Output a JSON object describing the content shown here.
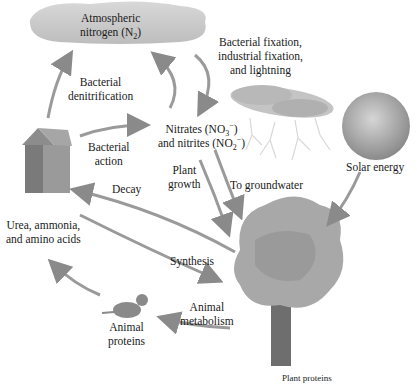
{
  "diagram": {
    "nodes": {
      "atmosphere": {
        "line1": "Atmospheric",
        "line2_pre": "nitrogen (N",
        "line2_sub": "2",
        "line2_post": ")"
      },
      "fixation": {
        "line1": "Bacterial fixation,",
        "line2": "industrial fixation,",
        "line3": "and lightning"
      },
      "nitrates": {
        "l1_pre": "Nitrates (NO",
        "l1_sub": "3",
        "l1_sup": "−",
        "l1_post": ")",
        "l2_pre": "and nitrites (NO",
        "l2_sub": "2",
        "l2_sup": "−",
        "l2_post": ")"
      },
      "solar": {
        "label": "Solar energy"
      },
      "urea": {
        "line1": "Urea, ammonia,",
        "line2": "and amino acids"
      },
      "animal_proteins": {
        "line1": "Animal",
        "line2": "proteins"
      },
      "plant": {
        "label": "Plant proteins"
      }
    },
    "processes": {
      "denitrification": {
        "line1": "Bacterial",
        "line2": "denitrification"
      },
      "bacterial_action": {
        "line1": "Bacterial",
        "line2": "action"
      },
      "plant_growth": {
        "line1": "Plant",
        "line2": "growth"
      },
      "groundwater": {
        "label": "To groundwater"
      },
      "decay": {
        "label": "Decay"
      },
      "synthesis": {
        "label": "Synthesis"
      },
      "animal_metabolism": {
        "line1": "Animal",
        "line2": "metabolism"
      }
    },
    "colors": {
      "cloud": "#c9c9c9",
      "arrow": "#9a9a9a",
      "tree_foliage": "#a8a8a8",
      "trunk": "#6e6e6e",
      "sun": "#a0a0a0",
      "text": "#1a1a1a"
    }
  }
}
